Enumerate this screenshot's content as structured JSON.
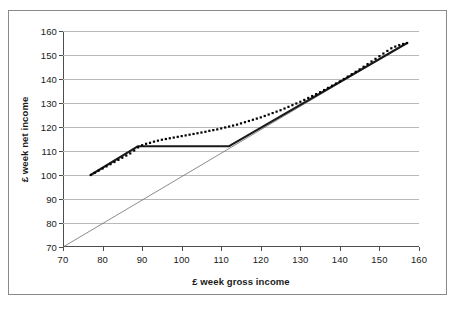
{
  "chart_data": {
    "type": "line",
    "title": "",
    "xlabel": "£ week gross income",
    "ylabel": "£ week net income",
    "xlim": [
      70,
      160
    ],
    "ylim": [
      70,
      160
    ],
    "xticks": [
      70,
      80,
      90,
      100,
      110,
      120,
      130,
      140,
      150,
      160
    ],
    "yticks": [
      70,
      80,
      90,
      100,
      110,
      120,
      130,
      140,
      150,
      160
    ],
    "grid": "horizontal",
    "legend": "none",
    "series": [
      {
        "name": "net income (dotted marker series)",
        "style": "dotted-markers",
        "color": "#000000",
        "x": [
          77,
          78,
          79,
          80,
          81,
          82,
          83,
          84,
          85,
          86,
          87,
          88,
          89,
          90,
          91,
          92,
          93,
          94,
          95,
          96,
          97,
          98,
          99,
          100,
          101,
          102,
          103,
          104,
          105,
          106,
          107,
          108,
          109,
          110,
          111,
          112,
          113,
          114,
          115,
          116,
          117,
          118,
          119,
          120,
          121,
          122,
          123,
          124,
          125,
          126,
          127,
          128,
          129,
          130,
          131,
          132,
          133,
          134,
          135,
          136,
          137,
          138,
          139,
          140,
          141,
          142,
          143,
          144,
          145,
          146,
          147,
          148,
          149,
          150,
          151,
          152,
          153,
          154,
          155,
          156,
          157
        ],
        "y": [
          100.0,
          100.9,
          101.8,
          102.7,
          103.6,
          104.5,
          105.4,
          106.3,
          107.2,
          108.1,
          109.0,
          110.2,
          111.5,
          112.4,
          113.0,
          113.4,
          113.9,
          114.3,
          114.7,
          115.0,
          115.3,
          115.6,
          115.9,
          116.2,
          116.5,
          116.8,
          117.1,
          117.4,
          117.7,
          118.0,
          118.4,
          118.7,
          119.0,
          119.4,
          119.8,
          120.2,
          120.6,
          121.0,
          121.5,
          122.0,
          122.5,
          123.0,
          123.5,
          124.0,
          124.6,
          125.2,
          125.8,
          126.4,
          127.0,
          127.7,
          128.4,
          129.1,
          129.8,
          130.5,
          131.3,
          132.1,
          132.9,
          133.7,
          134.5,
          135.4,
          136.3,
          137.2,
          138.1,
          139.0,
          140.0,
          141.0,
          142.0,
          143.0,
          144.0,
          145.1,
          146.2,
          147.3,
          148.4,
          149.5,
          150.6,
          151.7,
          152.8,
          153.5,
          154.1,
          154.6,
          155.0
        ]
      },
      {
        "name": "net income (solid line with plateau)",
        "style": "solid-thick",
        "color": "#1a1a1a",
        "x": [
          77,
          89,
          112,
          157
        ],
        "y": [
          100.0,
          112.0,
          112.0,
          155.0
        ]
      },
      {
        "name": "gross equals net reference line",
        "style": "solid-thin",
        "color": "#6e6e6e",
        "x": [
          70,
          157
        ],
        "y": [
          70.0,
          155.0
        ]
      }
    ]
  },
  "figure": {
    "background_color": "#ffffff",
    "frame_color": "#8a8a8a",
    "axis_color": "#4d4d4d",
    "gridline_color": "#b9b9b9"
  }
}
